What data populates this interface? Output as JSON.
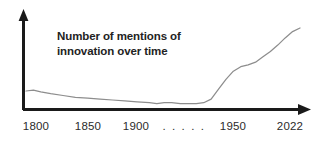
{
  "chart_data": {
    "type": "line",
    "title": "Number of mentions of innovation over time",
    "title_line1": "Number of mentions of",
    "title_line2": "innovation over time",
    "xlabel": "",
    "ylabel": "",
    "grid": false,
    "legend": null,
    "axis_style": {
      "x_axis_arrow": true,
      "y_axis_arrow": true,
      "axis_color": "#1a1a1a",
      "line_color": "#8d8d8d"
    },
    "tick_labels": [
      "1800",
      "1850",
      "1900",
      ". . . . .",
      "1950",
      "2022"
    ],
    "ticks": [
      {
        "label": "1800",
        "x_px": 36
      },
      {
        "label": "1850",
        "x_px": 88
      },
      {
        "label": "1900",
        "x_px": 136
      },
      {
        "label": ". . . . .",
        "x_px": 184
      },
      {
        "label": "1950",
        "x_px": 233
      },
      {
        "label": "2022",
        "x_px": 290
      }
    ],
    "xlim": [
      1800,
      2022
    ],
    "ylim": [
      0,
      100
    ],
    "x": [
      1800,
      1806,
      1812,
      1820,
      1830,
      1840,
      1850,
      1860,
      1870,
      1880,
      1890,
      1900,
      1906,
      1912,
      1918,
      1925,
      1932,
      1938,
      1944,
      1950,
      1956,
      1962,
      1968,
      1974,
      1980,
      1986,
      1992,
      1998,
      2004,
      2010,
      2016,
      2022
    ],
    "values": [
      20,
      21,
      19,
      17,
      15,
      13,
      12,
      11,
      10,
      9,
      8,
      7,
      6,
      7,
      7,
      6,
      6,
      6,
      7,
      11,
      22,
      33,
      42,
      47,
      49,
      52,
      58,
      64,
      71,
      79,
      86,
      90
    ],
    "annotations": [
      {
        "text": "Number of mentions of innovation over time",
        "x_px": 57,
        "y_px": 29
      }
    ]
  }
}
